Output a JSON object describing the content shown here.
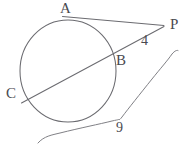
{
  "diagram": {
    "type": "geometry-figure",
    "stroke_color": "#6b6b70",
    "label_color": "#4a4a50",
    "background_color": "#ffffff",
    "circle": {
      "center_x": 68,
      "center_y": 71,
      "radius_x": 48,
      "radius_y": 51
    },
    "points": [
      {
        "id": "A",
        "label": "A",
        "x": 73,
        "y": 19,
        "label_x": 60,
        "label_y": 1,
        "role": "tangent-point"
      },
      {
        "id": "P",
        "label": "P",
        "x": 163,
        "y": 26,
        "label_x": 170,
        "label_y": 17,
        "role": "external-point"
      },
      {
        "id": "B",
        "label": "B",
        "x": 113,
        "y": 58,
        "label_x": 116,
        "label_y": 53,
        "role": "near-secant-intersection"
      },
      {
        "id": "C",
        "label": "C",
        "x": 31,
        "y": 101,
        "label_x": 6,
        "label_y": 86,
        "role": "far-secant-intersection"
      }
    ],
    "segments": [
      {
        "id": "tangent-AP",
        "from": "A",
        "to": "P",
        "measure_label": ""
      },
      {
        "id": "secant-CP",
        "from": "C",
        "to": "P",
        "measure_label": ""
      }
    ],
    "measures": [
      {
        "id": "bp-length",
        "value": "4",
        "label_x": 141,
        "label_y": 34,
        "describes": "segment BP"
      },
      {
        "id": "cp-length",
        "value": "9",
        "label_x": 116,
        "label_y": 121,
        "describes": "segment CP (brace)"
      }
    ],
    "brace": {
      "id": "cp-brace",
      "measure": "9",
      "start_x": 38,
      "start_y": 143,
      "end_x": 177,
      "end_y": 50,
      "tick_x": 118,
      "tick_y": 120
    }
  }
}
